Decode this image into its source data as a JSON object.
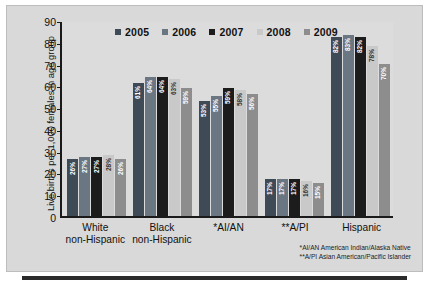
{
  "chart_data": {
    "type": "bar",
    "title": "",
    "xlabel": "",
    "ylabel": "Live births per 1,000 females in age group",
    "ylim": [
      0,
      90
    ],
    "yticks": [
      0,
      10,
      20,
      30,
      40,
      50,
      60,
      70,
      80,
      90
    ],
    "grid": false,
    "legend_position": "top-center",
    "categories": [
      "White non-Hispanic",
      "Black non-Hispanic",
      "*AI/AN",
      "**A/PI",
      "Hispanic"
    ],
    "category_lines": [
      [
        "White",
        "non-Hispanic"
      ],
      [
        "Black",
        "non-Hispanic"
      ],
      [
        "*AI/AN",
        ""
      ],
      [
        "**A/PI",
        ""
      ],
      [
        "Hispanic",
        ""
      ]
    ],
    "series": [
      {
        "name": "2005",
        "color": "#3f4a57",
        "values": [
          26,
          61,
          53,
          17,
          82
        ],
        "labels": [
          "26%",
          "61%",
          "53%",
          "17%",
          "82%"
        ]
      },
      {
        "name": "2006",
        "color": "#6b7683",
        "values": [
          27,
          64,
          55,
          17,
          83
        ],
        "labels": [
          "27%",
          "64%",
          "55%",
          "17%",
          "83%"
        ]
      },
      {
        "name": "2007",
        "color": "#1c1c1c",
        "values": [
          27,
          64,
          59,
          17,
          82
        ],
        "labels": [
          "27%",
          "64%",
          "59%",
          "17%",
          "82%"
        ]
      },
      {
        "name": "2008",
        "color": "#c9c9c9",
        "values": [
          28,
          63,
          58,
          16,
          78
        ],
        "labels": [
          "28%",
          "63%",
          "58%",
          "16%",
          "78%"
        ]
      },
      {
        "name": "2009",
        "color": "#8d8d8d",
        "values": [
          26,
          59,
          56,
          15,
          70
        ],
        "labels": [
          "26%",
          "59%",
          "56%",
          "15%",
          "70%"
        ]
      }
    ],
    "footnotes": [
      "*AI/AN American Indian/Alaska Native",
      "**A/PI Asian American/Pacific Islander"
    ]
  }
}
